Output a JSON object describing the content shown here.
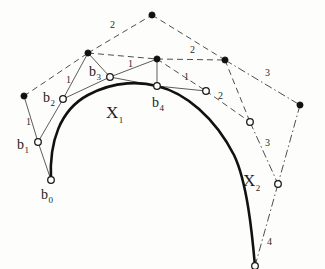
{
  "figure": {
    "background": "#fdfdfc",
    "ink": "#111111",
    "width": 325,
    "height": 269
  },
  "curves": [
    {
      "name": "X1",
      "label": "X",
      "subscript": "1",
      "label_pos": {
        "x": 106,
        "y": 118
      },
      "path": "M 51,180 C 49,142 60,110 88,95 C 116,80 142,82 157,86"
    },
    {
      "name": "X2",
      "label": "X",
      "subscript": "2",
      "label_pos": {
        "x": 243,
        "y": 186
      },
      "path": "M 157,86 C 186,93 215,118 234,155 C 247,182 252,232 255,266"
    }
  ],
  "control_points": [
    {
      "id": "b0",
      "label": "b",
      "subscript": "0",
      "type": "open",
      "x": 51,
      "y": 180,
      "label_x": 41,
      "label_y": 199
    },
    {
      "id": "b1",
      "label": "b",
      "subscript": "1",
      "type": "open",
      "x": 38,
      "y": 142,
      "label_x": 17,
      "label_y": 149
    },
    {
      "id": "b2",
      "label": "b",
      "subscript": "2",
      "type": "open",
      "x": 63,
      "y": 99,
      "label_x": 43,
      "label_y": 102
    },
    {
      "id": "b3",
      "label": "b",
      "subscript": "3",
      "type": "open",
      "x": 110,
      "y": 77,
      "label_x": 89,
      "label_y": 76
    },
    {
      "id": "b4",
      "label": "b",
      "subscript": "4",
      "type": "open",
      "x": 157,
      "y": 86,
      "label_x": 152,
      "label_y": 107
    },
    {
      "id": "r1",
      "label": "",
      "subscript": "",
      "type": "open",
      "x": 206,
      "y": 91,
      "label_x": 0,
      "label_y": 0
    },
    {
      "id": "r2",
      "label": "",
      "subscript": "",
      "type": "open",
      "x": 250,
      "y": 122,
      "label_x": 0,
      "label_y": 0
    },
    {
      "id": "r3",
      "label": "",
      "subscript": "",
      "type": "open",
      "x": 278,
      "y": 184,
      "label_x": 0,
      "label_y": 0
    },
    {
      "id": "r4",
      "label": "",
      "subscript": "",
      "type": "open",
      "x": 255,
      "y": 266,
      "label_x": 0,
      "label_y": 0
    }
  ],
  "outer_points": [
    {
      "id": "p-left",
      "type": "filled",
      "x": 24,
      "y": 96
    },
    {
      "id": "p-upperleft",
      "type": "filled",
      "x": 88,
      "y": 53
    },
    {
      "id": "p-apex",
      "type": "filled",
      "x": 152,
      "y": 15
    },
    {
      "id": "p-mid",
      "type": "filled",
      "x": 157,
      "y": 59
    },
    {
      "id": "p-upperight",
      "type": "filled",
      "x": 225,
      "y": 60
    },
    {
      "id": "p-right",
      "type": "filled",
      "x": 300,
      "y": 105
    }
  ],
  "leg_lines": [
    {
      "id": "leg-b0-b1",
      "from": "b0",
      "to": "b1"
    },
    {
      "id": "leg-b1-b2",
      "from": "b1",
      "to": "b2"
    },
    {
      "id": "leg-b2-b3",
      "from": "b2",
      "to": "b3"
    },
    {
      "id": "leg-b3-b4",
      "from": "b3",
      "to": "b4"
    },
    {
      "id": "leg-b4-r1",
      "from": "b4",
      "to": "r1"
    },
    {
      "id": "leg-b1-pleft",
      "from": "b1",
      "to": "p-left"
    },
    {
      "id": "leg-b2-pul",
      "from": "b2",
      "to": "p-upperleft"
    },
    {
      "id": "leg-b3-pul",
      "from": "b3",
      "to": "p-upperleft"
    },
    {
      "id": "leg-b3-pmid",
      "from": "b3",
      "to": "p-mid"
    },
    {
      "id": "leg-b4-pmid",
      "from": "b4",
      "to": "p-mid"
    }
  ],
  "dashed_lines": [
    {
      "id": "d-pleft-pul",
      "from": "p-left",
      "to": "p-upperleft"
    },
    {
      "id": "d-pul-apex",
      "from": "p-upperleft",
      "to": "p-apex"
    },
    {
      "id": "d-apex-pur",
      "from": "p-apex",
      "to": "p-upperight"
    },
    {
      "id": "d-pul-pmid",
      "from": "p-upperleft",
      "to": "p-mid"
    },
    {
      "id": "d-pmid-pur",
      "from": "p-mid",
      "to": "p-upperight"
    },
    {
      "id": "d-pmid-r1",
      "from": "p-mid",
      "to": "r1"
    },
    {
      "id": "d-r1-r2",
      "from": "r1",
      "to": "r2"
    },
    {
      "id": "d-pur-r2",
      "from": "p-upperight",
      "to": "r2"
    }
  ],
  "dashdot_lines": [
    {
      "id": "dd-pur-pright",
      "from": "p-upperight",
      "to": "p-right"
    },
    {
      "id": "dd-pright-r3",
      "from": "p-right",
      "to": "r3"
    },
    {
      "id": "dd-r2-r3",
      "from": "r2",
      "to": "r3"
    },
    {
      "id": "dd-r3-r4",
      "from": "r3",
      "to": "r4"
    }
  ],
  "ratio_labels": [
    {
      "id": "n-left-1",
      "text": "1",
      "x": 26,
      "y": 125
    },
    {
      "id": "n-b2-1",
      "text": "1",
      "x": 66,
      "y": 83
    },
    {
      "id": "n-top-2",
      "text": "2",
      "x": 110,
      "y": 28
    },
    {
      "id": "n-b3-1",
      "text": "1",
      "x": 128,
      "y": 67
    },
    {
      "id": "n-mid-2",
      "text": "2",
      "x": 190,
      "y": 53
    },
    {
      "id": "n-b4-1",
      "text": "1",
      "x": 184,
      "y": 80
    },
    {
      "id": "n-r1-2",
      "text": "2",
      "x": 218,
      "y": 99
    },
    {
      "id": "n-upper-3",
      "text": "3",
      "x": 265,
      "y": 76
    },
    {
      "id": "n-lower-3",
      "text": "3",
      "x": 265,
      "y": 146
    },
    {
      "id": "n-bottom-4",
      "text": "4",
      "x": 267,
      "y": 245
    }
  ]
}
